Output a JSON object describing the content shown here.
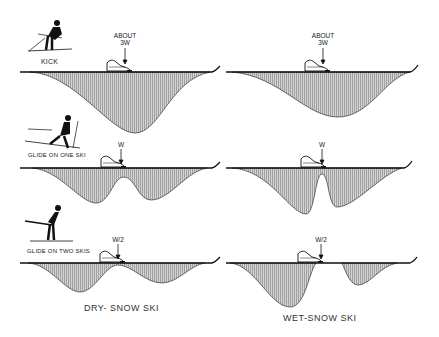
{
  "rows": [
    {
      "label": "KICK",
      "load": [
        "ABOUT",
        "3W"
      ]
    },
    {
      "label": "GLIDE ON ONE SKI",
      "load": [
        "W"
      ]
    },
    {
      "label": "GLIDE ON TWO SKIS",
      "load": [
        "W/2"
      ]
    }
  ],
  "columns": [
    {
      "caption": "DRY- SNOW SKI"
    },
    {
      "caption": "WET-SNOW SKI"
    }
  ],
  "icons": [
    "skier-kick-icon",
    "skier-glide-one-ski-icon",
    "skier-glide-two-skis-icon",
    "boot-icon",
    "down-arrow-icon"
  ],
  "colors": {
    "ink": "#111111",
    "fill": "#bdbdbd",
    "background": "#ffffff"
  }
}
